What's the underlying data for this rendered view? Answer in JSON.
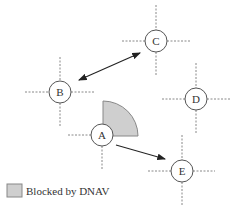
{
  "diagram": {
    "nodes": [
      {
        "id": "A",
        "label": "A",
        "cx": 102,
        "cy": 135
      },
      {
        "id": "B",
        "label": "B",
        "cx": 60,
        "cy": 92
      },
      {
        "id": "C",
        "label": "C",
        "cx": 156,
        "cy": 41
      },
      {
        "id": "D",
        "label": "D",
        "cx": 196,
        "cy": 99
      },
      {
        "id": "E",
        "label": "E",
        "cx": 182,
        "cy": 171
      }
    ],
    "edges": [
      {
        "from": "B",
        "to": "C",
        "type": "bidirectional"
      },
      {
        "from": "A",
        "to": "E",
        "type": "directed"
      }
    ],
    "blocked_sector": {
      "node": "A",
      "description": "quarter-circle sector to the upper-right of A, blocked by DNAV"
    },
    "legend": {
      "label": "Blocked by DNAV",
      "swatch_color": "#cfcfcf"
    },
    "colors": {
      "sector_fill": "#cfcfcf",
      "sector_stroke": "#888888",
      "node_stroke": "#555555",
      "dash_stroke": "#888888",
      "arrow": "#222222"
    }
  }
}
